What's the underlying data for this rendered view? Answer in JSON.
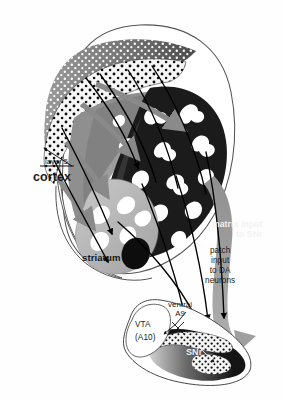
{
  "figure": {
    "type": "anatomical-schematic-diagram",
    "background_color": "#ffffff",
    "outline_color": "#4a4a4a"
  },
  "labels": {
    "cortex": "cortex",
    "layer5": "layer 5",
    "striatum": "striatum",
    "matrix_input": "matrix input\nto SNr",
    "patch_input": "patch\ninput\nto DA\nneurons",
    "ventral_a9": "ventral\nA9",
    "vta": "VTA\n(A10)",
    "snr": "SNr"
  },
  "regions": [
    {
      "name": "cortex-outer-hull",
      "label": "cortex",
      "fill": "#ffffff",
      "stroke": "#4a4a4a"
    },
    {
      "name": "cortical-superficial-layers",
      "description": "gray band with white dot stipple",
      "fill": "#7d7d7d",
      "dot_color": "#ffffff"
    },
    {
      "name": "cortical-layer-5",
      "description": "white band with black dot stipple",
      "fill": "#f4f4f4",
      "dot_color": "#111111"
    },
    {
      "name": "striatum-dark-matrix",
      "description": "dark striatal matrix field bearing white patches",
      "fill": "#1c1c1c",
      "patch_color": "#ffffff"
    },
    {
      "name": "striatum-light-lobe",
      "description": "light gray ventral striatal lobe with white patches",
      "fill": "#b4b4b4",
      "patch_color": "#ffffff"
    },
    {
      "name": "striatum-mid-gray-band",
      "fill": "#8c8c8c"
    },
    {
      "name": "matrix-output-band",
      "label": "matrix input to SNr",
      "description": "broad gray band sweeping from striatum to SNr",
      "fill": "#9a9a9a"
    },
    {
      "name": "substantia-nigra-complex",
      "fill": "#171717",
      "stroke": "#3c3c3c"
    },
    {
      "name": "vta-a10",
      "label": "VTA (A10)",
      "fill": "#ffffff",
      "stroke": "#3c3c3c"
    },
    {
      "name": "snr-pars-reticulata",
      "label": "SNr",
      "fill": "#6e6e6e"
    },
    {
      "name": "dopamine-cell-dotted-band",
      "description": "white band studded with dark dots marking DA neurons",
      "fill": "#f2f2f2",
      "dot_color": "#101010"
    },
    {
      "name": "black-striatal-blob",
      "fill": "#0d0d0d"
    }
  ],
  "arrows": [
    {
      "name": "gray-corticostriatal-arrow-1",
      "color": "#8a8a8a",
      "from": "cortex",
      "to": "striatum-matrix"
    },
    {
      "name": "gray-corticostriatal-arrow-2",
      "color": "#8a8a8a",
      "from": "cortex",
      "to": "striatum-matrix"
    },
    {
      "name": "gray-corticostriatal-arrow-3",
      "color": "#8a8a8a",
      "from": "cortex",
      "to": "striatum-matrix"
    },
    {
      "name": "gray-corticostriatal-arrow-4",
      "color": "#8a8a8a",
      "from": "cortex",
      "to": "striatum-ventral"
    },
    {
      "name": "black-patch-arrow-1",
      "color": "#000000",
      "from": "layer-5",
      "to": "striatal-patch"
    },
    {
      "name": "black-patch-arrow-2",
      "color": "#000000",
      "from": "layer-5",
      "to": "striatal-patch"
    },
    {
      "name": "black-patch-arrow-3",
      "color": "#000000",
      "from": "layer-5",
      "to": "striatal-patch"
    },
    {
      "name": "black-patch-projection-to-da-1",
      "color": "#000000",
      "from": "striatal-patch",
      "to": "dopamine-neurons"
    },
    {
      "name": "black-patch-projection-to-da-2",
      "color": "#000000",
      "from": "striatal-patch",
      "to": "dopamine-neurons"
    },
    {
      "name": "black-patch-projection-to-da-3",
      "color": "#000000",
      "from": "striatal-patch",
      "to": "dopamine-neurons"
    },
    {
      "name": "gray-matrix-arrowhead-to-snr",
      "color": "#9a9a9a",
      "from": "striatum-matrix",
      "to": "snr"
    },
    {
      "name": "layer5-leader-arrow",
      "color": "#111111",
      "from": "layer-5-label",
      "to": "cortical-layer-5"
    },
    {
      "name": "ventral-a9-leader",
      "color": "#111111",
      "from": "ventral-a9-label",
      "to": "ventral-a9-cells"
    }
  ]
}
